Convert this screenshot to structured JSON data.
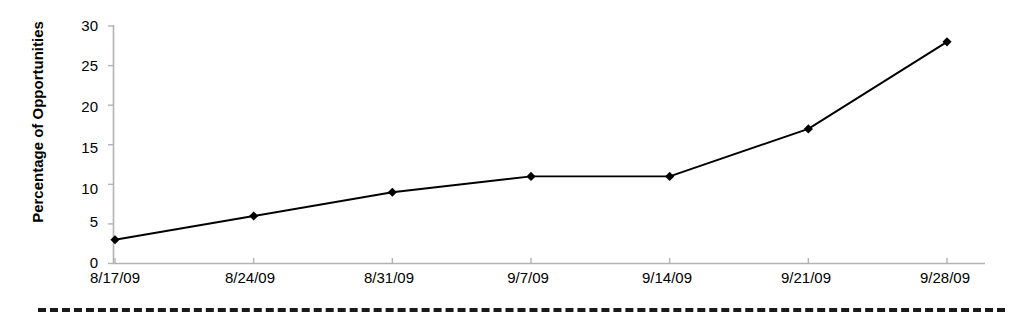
{
  "chart_data": {
    "type": "line",
    "title": "",
    "subtitle": "",
    "xlabel": "",
    "ylabel": "Percentage of Opportunities",
    "categories": [
      "8/17/09",
      "8/24/09",
      "8/31/09",
      "9/7/09",
      "9/14/09",
      "9/21/09",
      "9/28/09"
    ],
    "values": [
      3,
      6,
      9,
      11,
      11,
      17,
      28
    ],
    "series": [
      {
        "name": "Percentage of Opportunities",
        "values": [
          3,
          6,
          9,
          11,
          11,
          17,
          28
        ],
        "color": "#000000",
        "marker": "diamond",
        "marker_color": "#000000"
      }
    ],
    "ylim": [
      0,
      30
    ],
    "yticks": [
      0,
      5,
      10,
      15,
      20,
      25,
      30
    ],
    "ytick_labels": [
      "0",
      "5",
      "10",
      "15",
      "20",
      "25",
      "30"
    ],
    "xtick_labels": [
      "8/17/09",
      "8/24/09",
      "8/31/09",
      "9/7/09",
      "9/14/09",
      "9/21/09",
      "9/28/09"
    ],
    "grid": false,
    "legend": false,
    "legend_position": "none",
    "axis_color": "#b3b3b3",
    "line_color": "#000000",
    "background_color": "#ffffff"
  },
  "axes": {
    "y_title": "Percentage of Opportunities",
    "y_ticks": [
      {
        "label": "30",
        "value": 30
      },
      {
        "label": "25",
        "value": 25
      },
      {
        "label": "20",
        "value": 20
      },
      {
        "label": "15",
        "value": 15
      },
      {
        "label": "10",
        "value": 10
      },
      {
        "label": "5",
        "value": 5
      },
      {
        "label": "0",
        "value": 0
      }
    ],
    "x_ticks": [
      {
        "label": "8/17/09"
      },
      {
        "label": "8/24/09"
      },
      {
        "label": "8/31/09"
      },
      {
        "label": "9/7/09"
      },
      {
        "label": "9/14/09"
      },
      {
        "label": "9/21/09"
      },
      {
        "label": "9/28/09"
      }
    ]
  },
  "decoration": {
    "bottom_divider": "dashed-rule"
  }
}
